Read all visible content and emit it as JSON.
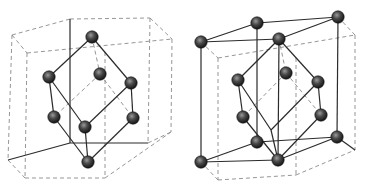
{
  "figure": {
    "panels": [
      {
        "id": "left",
        "description": "Hexagonal prism with rhombohedral primitive cell",
        "atom_color": "#3a3a3a",
        "atoms": [
          {
            "x": 92,
            "y": 37
          },
          {
            "x": 49,
            "y": 77
          },
          {
            "x": 100,
            "y": 74
          },
          {
            "x": 131,
            "y": 83
          },
          {
            "x": 54,
            "y": 117
          },
          {
            "x": 85,
            "y": 127
          },
          {
            "x": 133,
            "y": 118
          },
          {
            "x": 88,
            "y": 162
          }
        ],
        "solid_edges": [
          [
            92,
            37,
            49,
            77
          ],
          [
            92,
            37,
            131,
            83
          ],
          [
            49,
            77,
            54,
            117
          ],
          [
            49,
            77,
            85,
            127
          ],
          [
            131,
            83,
            133,
            118
          ],
          [
            131,
            83,
            85,
            127
          ],
          [
            54,
            117,
            88,
            162
          ],
          [
            85,
            127,
            88,
            162
          ],
          [
            133,
            118,
            88,
            162
          ],
          [
            70,
            19,
            70,
            143
          ],
          [
            70,
            143,
            148,
            143
          ],
          [
            8,
            160,
            70,
            143
          ]
        ],
        "dashed_edges": [
          [
            12,
            35,
            70,
            19
          ],
          [
            70,
            19,
            150,
            18
          ],
          [
            150,
            18,
            172,
            39
          ],
          [
            12,
            35,
            27,
            53
          ],
          [
            27,
            53,
            172,
            39
          ],
          [
            12,
            35,
            8,
            160
          ],
          [
            27,
            53,
            25,
            178
          ],
          [
            172,
            39,
            171,
            132
          ],
          [
            150,
            18,
            148,
            143
          ],
          [
            8,
            160,
            25,
            178
          ],
          [
            25,
            178,
            105,
            178
          ],
          [
            105,
            178,
            171,
            132
          ],
          [
            148,
            143,
            171,
            132
          ],
          [
            92,
            37,
            100,
            74
          ],
          [
            100,
            74,
            54,
            117
          ],
          [
            100,
            74,
            133,
            118
          ],
          [
            105,
            52,
            105,
            178
          ]
        ]
      },
      {
        "id": "right",
        "description": "Hexagonal prism with atoms at corners and rhombohedral cell",
        "atom_color": "#3a3a3a",
        "atoms": [
          {
            "x": 201,
            "y": 42
          },
          {
            "x": 257,
            "y": 23
          },
          {
            "x": 338,
            "y": 17
          },
          {
            "x": 279,
            "y": 39
          },
          {
            "x": 238,
            "y": 80
          },
          {
            "x": 286,
            "y": 73
          },
          {
            "x": 318,
            "y": 82
          },
          {
            "x": 243,
            "y": 117
          },
          {
            "x": 321,
            "y": 115
          },
          {
            "x": 257,
            "y": 142
          },
          {
            "x": 337,
            "y": 137
          },
          {
            "x": 201,
            "y": 162
          },
          {
            "x": 278,
            "y": 160
          }
        ],
        "solid_edges": [
          [
            201,
            42,
            257,
            23
          ],
          [
            257,
            23,
            338,
            17
          ],
          [
            201,
            42,
            279,
            39
          ],
          [
            279,
            39,
            338,
            17
          ],
          [
            201,
            42,
            201,
            162
          ],
          [
            257,
            23,
            257,
            142
          ],
          [
            338,
            17,
            337,
            137
          ],
          [
            279,
            39,
            278,
            160
          ],
          [
            279,
            39,
            238,
            80
          ],
          [
            279,
            39,
            318,
            82
          ],
          [
            238,
            80,
            243,
            117
          ],
          [
            318,
            82,
            321,
            115
          ],
          [
            238,
            80,
            271,
            130
          ],
          [
            318,
            82,
            271,
            130
          ],
          [
            271,
            130,
            278,
            160
          ],
          [
            243,
            117,
            278,
            160
          ],
          [
            321,
            115,
            278,
            160
          ],
          [
            201,
            162,
            257,
            142
          ],
          [
            257,
            142,
            337,
            137
          ],
          [
            201,
            162,
            278,
            160
          ],
          [
            278,
            160,
            337,
            137
          ],
          [
            337,
            137,
            355,
            150
          ]
        ],
        "dashed_edges": [
          [
            201,
            42,
            218,
            58
          ],
          [
            218,
            58,
            355,
            35
          ],
          [
            338,
            17,
            355,
            35
          ],
          [
            218,
            58,
            218,
            180
          ],
          [
            355,
            35,
            355,
            150
          ],
          [
            201,
            162,
            218,
            180
          ],
          [
            218,
            180,
            296,
            175
          ],
          [
            296,
            175,
            355,
            150
          ],
          [
            296,
            58,
            296,
            175
          ],
          [
            279,
            39,
            286,
            73
          ],
          [
            286,
            73,
            243,
            117
          ],
          [
            286,
            73,
            321,
            115
          ]
        ]
      }
    ]
  }
}
